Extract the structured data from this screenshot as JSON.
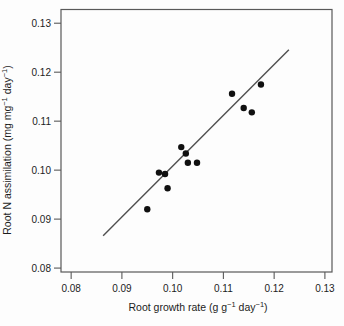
{
  "figure": {
    "background": "#fdfdfd"
  },
  "chart_data": {
    "type": "scatter",
    "title": "",
    "xlabel": "Root growth rate (g g⁻¹ day⁻¹)",
    "ylabel": "Root N assimilation (mg mg⁻¹ day⁻¹)",
    "xlabel_segments": [
      {
        "text": "Root growth rate (g g"
      },
      {
        "text": "−1",
        "sup": true
      },
      {
        "text": " day"
      },
      {
        "text": "−1",
        "sup": true
      },
      {
        "text": ")"
      }
    ],
    "ylabel_segments": [
      {
        "text": "Root N assimilation (mg mg"
      },
      {
        "text": "−1",
        "sup": true
      },
      {
        "text": " day"
      },
      {
        "text": "−1",
        "sup": true
      },
      {
        "text": ")"
      }
    ],
    "xlim": [
      0.078,
      0.1314
    ],
    "ylim": [
      0.0792,
      0.1328
    ],
    "x_ticks": [
      0.08,
      0.09,
      0.1,
      0.11,
      0.12,
      0.13
    ],
    "x_tick_labels": [
      "0.08",
      "0.09",
      "0.10",
      "0.11",
      "0.12",
      "0.13"
    ],
    "y_ticks": [
      0.08,
      0.09,
      0.1,
      0.11,
      0.12,
      0.13
    ],
    "y_tick_labels": [
      "0.08",
      "0.09",
      "0.10",
      "0.11",
      "0.12",
      "0.13"
    ],
    "grid": false,
    "legend": null,
    "points": [
      [
        0.095,
        0.092
      ],
      [
        0.099,
        0.0963
      ],
      [
        0.0973,
        0.0995
      ],
      [
        0.0985,
        0.0992
      ],
      [
        0.1017,
        0.1047
      ],
      [
        0.1026,
        0.1034
      ],
      [
        0.103,
        0.1015
      ],
      [
        0.1048,
        0.1015
      ],
      [
        0.1117,
        0.1156
      ],
      [
        0.114,
        0.1127
      ],
      [
        0.1156,
        0.1118
      ],
      [
        0.1174,
        0.1175
      ]
    ],
    "trendline": {
      "x1": 0.0863,
      "y1": 0.0866,
      "x2": 0.1229,
      "y2": 0.1246
    },
    "marker": {
      "shape": "circle",
      "radius": 3.2
    },
    "colors": {
      "point": "#101010",
      "line": "#4f4f4f",
      "frame": "#595959",
      "text": "#1c1c1c"
    }
  }
}
